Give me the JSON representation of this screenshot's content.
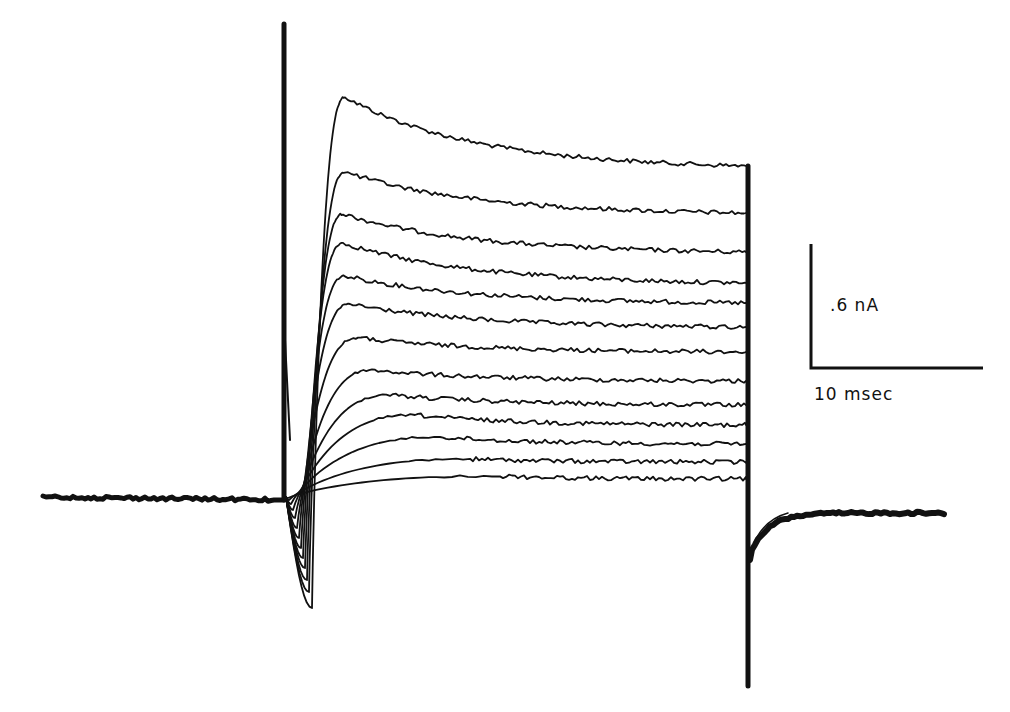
{
  "chart_data": {
    "type": "line",
    "title": "",
    "xlabel": "",
    "ylabel": "",
    "grid": false,
    "legend": null,
    "scale_bar": {
      "vertical": {
        "label": ".6 nA",
        "value": 0.6,
        "unit": "nA"
      },
      "horizontal": {
        "label": "10 msec",
        "value": 10,
        "unit": "msec"
      }
    },
    "time_window_msec": {
      "step_on": 0,
      "step_off": 47.5,
      "record_start": -13.3,
      "record_end": 58.6
    },
    "baseline_nA": 0,
    "series": [
      {
        "name": "sweep 1",
        "peak_nA": 2.0,
        "steady_nA": 1.61,
        "peak_time_msec": 3.6
      },
      {
        "name": "sweep 2",
        "peak_nA": 1.57,
        "steady_nA": 1.38,
        "peak_time_msec": 3.6
      },
      {
        "name": "sweep 3",
        "peak_nA": 1.36,
        "steady_nA": 1.19,
        "peak_time_msec": 3.5
      },
      {
        "name": "sweep 4",
        "peak_nA": 1.22,
        "steady_nA": 1.04,
        "peak_time_msec": 3.5
      },
      {
        "name": "sweep 5",
        "peak_nA": 1.07,
        "steady_nA": 0.95,
        "peak_time_msec": 3.6
      },
      {
        "name": "sweep 6",
        "peak_nA": 0.93,
        "steady_nA": 0.83,
        "peak_time_msec": 3.8
      },
      {
        "name": "sweep 7",
        "peak_nA": 0.77,
        "steady_nA": 0.71,
        "peak_time_msec": 4.2
      },
      {
        "name": "sweep 8",
        "peak_nA": 0.61,
        "steady_nA": 0.57,
        "peak_time_msec": 5.0
      },
      {
        "name": "sweep 9",
        "peak_nA": 0.49,
        "steady_nA": 0.45,
        "peak_time_msec": 6.0
      },
      {
        "name": "sweep 10",
        "peak_nA": 0.39,
        "steady_nA": 0.36,
        "peak_time_msec": 7.5
      },
      {
        "name": "sweep 11",
        "peak_nA": 0.29,
        "steady_nA": 0.27,
        "peak_time_msec": 9.0
      },
      {
        "name": "sweep 12",
        "peak_nA": 0.18,
        "steady_nA": 0.18,
        "peak_time_msec": 11.0
      },
      {
        "name": "sweep 13",
        "peak_nA": 0.1,
        "steady_nA": 0.1,
        "peak_time_msec": 13.0
      }
    ],
    "render": {
      "baseline_y": 497,
      "x_start": 43,
      "x_on": 284,
      "x_off": 748,
      "x_end": 945,
      "spike_top_y": 24,
      "off_min_y": 686,
      "tail_recover_y": 513,
      "px_per_nA": 206.7,
      "px_per_msec": 17.2,
      "traces": [
        {
          "peak_x": 345,
          "peak_y": 97,
          "end_y": 166,
          "dip_x": 312,
          "dip_y": 608
        },
        {
          "peak_x": 345,
          "peak_y": 172,
          "end_y": 213,
          "dip_x": 309,
          "dip_y": 592
        },
        {
          "peak_x": 343,
          "peak_y": 214,
          "end_y": 252,
          "dip_x": 307,
          "dip_y": 580
        },
        {
          "peak_x": 343,
          "peak_y": 243,
          "end_y": 283,
          "dip_x": 305,
          "dip_y": 568
        },
        {
          "peak_x": 345,
          "peak_y": 276,
          "end_y": 303,
          "dip_x": 303,
          "dip_y": 558
        },
        {
          "peak_x": 350,
          "peak_y": 304,
          "end_y": 327,
          "dip_x": 301,
          "dip_y": 548
        },
        {
          "peak_x": 358,
          "peak_y": 338,
          "end_y": 352,
          "dip_x": 299,
          "dip_y": 538
        },
        {
          "peak_x": 372,
          "peak_y": 370,
          "end_y": 381,
          "dip_x": 297,
          "dip_y": 528
        },
        {
          "peak_x": 390,
          "peak_y": 395,
          "end_y": 405,
          "dip_x": 295,
          "dip_y": 518
        },
        {
          "peak_x": 415,
          "peak_y": 415,
          "end_y": 425,
          "dip_x": 293,
          "dip_y": 510
        },
        {
          "peak_x": 440,
          "peak_y": 437,
          "end_y": 444,
          "dip_x": 291,
          "dip_y": 504
        },
        {
          "peak_x": 470,
          "peak_y": 459,
          "end_y": 462,
          "dip_x": 289,
          "dip_y": 500
        },
        {
          "peak_x": 500,
          "peak_y": 476,
          "end_y": 479,
          "dip_x": 288,
          "dip_y": 498
        }
      ],
      "scale_bar_geom": {
        "x": 811,
        "y_top": 244,
        "y_bottom": 368,
        "x_right": 983
      }
    }
  }
}
